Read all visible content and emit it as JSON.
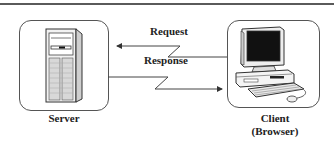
{
  "diagram": {
    "nodes": [
      {
        "id": "server",
        "label": "Server",
        "icon": "server-tower-icon"
      },
      {
        "id": "client",
        "label": "Client\n(Browser)",
        "label_line1": "Client",
        "label_line2": "(Browser)",
        "icon": "desktop-computer-icon"
      }
    ],
    "edges": [
      {
        "from": "client",
        "to": "server",
        "label": "Request",
        "style": "lightning-arrow"
      },
      {
        "from": "server",
        "to": "client",
        "label": "Response",
        "style": "lightning-arrow"
      }
    ],
    "colors": {
      "line": "#444444",
      "box_border": "#555555",
      "background": "#ffffff",
      "screen": "#111111"
    }
  }
}
